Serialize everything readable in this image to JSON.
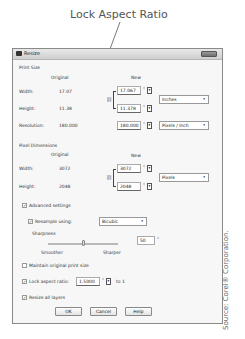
{
  "callout": {
    "label": "Lock Aspect Ratio"
  },
  "dialog": {
    "title": "Resize",
    "print_size": {
      "section_label": "Print Size",
      "col_original": "Original",
      "col_new": "New",
      "width_label": "Width:",
      "width_original": "17.07",
      "width_new": "17.067",
      "height_label": "Height:",
      "height_original": "11.38",
      "height_new": "11.378",
      "units": "Inches",
      "resolution_label": "Resolution:",
      "resolution_original": "180.000",
      "resolution_new": "180.000",
      "resolution_units": "Pixels / Inch"
    },
    "pixel_dimensions": {
      "section_label": "Pixel Dimensions",
      "col_original": "Original",
      "col_new": "New",
      "width_label": "Width:",
      "width_original": "3072",
      "width_new": "3072",
      "height_label": "Height:",
      "height_original": "2048",
      "height_new": "2048",
      "units": "Pixels"
    },
    "advanced": {
      "advanced_settings_label": "Advanced settings",
      "advanced_settings_checked": true,
      "resample_label": "Resample using:",
      "resample_checked": true,
      "resample_method": "Bicubic",
      "sharpness_label": "Sharpness",
      "sharpness_value": "50",
      "smoother_label": "Smoother",
      "sharper_label": "Sharper",
      "maintain_label": "Maintain original print size",
      "maintain_checked": false,
      "lock_label": "Lock aspect ratio:",
      "lock_checked": true,
      "lock_value": "1.5000",
      "lock_suffix": "to 1",
      "resize_layers_label": "Resize all layers",
      "resize_layers_checked": true
    },
    "buttons": {
      "ok": "OK",
      "cancel": "Cancel",
      "help": "Help"
    }
  },
  "source_credit": "Source: Corel® Corporation.",
  "glyphs": {
    "check": "✓",
    "chain": "⛓",
    "down": "▾",
    "updown": "⇕"
  }
}
